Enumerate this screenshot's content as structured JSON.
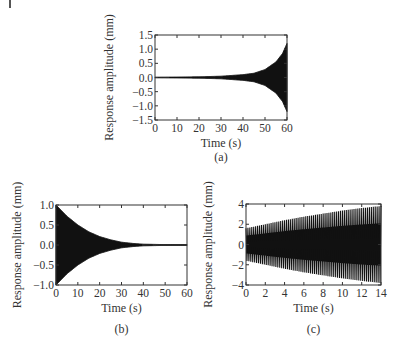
{
  "chart_data": [
    {
      "panel": "(a)",
      "type": "line",
      "title": "",
      "xlabel": "Time (s)",
      "ylabel": "Response amplitude (mm)",
      "xlim": [
        0,
        60
      ],
      "ylim": [
        -1.5,
        1.5
      ],
      "xticks": [
        0,
        10,
        20,
        30,
        40,
        50,
        60
      ],
      "yticks": [
        -1.5,
        -1.0,
        -0.5,
        0.0,
        0.5,
        1.0,
        1.5
      ],
      "ytick_labels": [
        "−1.5",
        "−1.0",
        "−0.5",
        "0.0",
        "0.5",
        "1.0",
        "1.5"
      ],
      "grid": false,
      "description": "Dense oscillation with exponentially growing envelope",
      "envelope": {
        "x": [
          0,
          10,
          20,
          30,
          40,
          45,
          50,
          55,
          58,
          60
        ],
        "upper": [
          0.01,
          0.015,
          0.025,
          0.045,
          0.1,
          0.15,
          0.28,
          0.55,
          0.85,
          1.2
        ],
        "lower": [
          -0.01,
          -0.015,
          -0.025,
          -0.045,
          -0.1,
          -0.15,
          -0.28,
          -0.55,
          -0.85,
          -1.2
        ]
      },
      "caption": "(a)"
    },
    {
      "panel": "(b)",
      "type": "line",
      "title": "",
      "xlabel": "Time (s)",
      "ylabel": "Response amplitude (mm)",
      "xlim": [
        0,
        60
      ],
      "ylim": [
        -1.0,
        1.0
      ],
      "xticks": [
        0,
        10,
        20,
        30,
        40,
        50,
        60
      ],
      "yticks": [
        -1.0,
        -0.5,
        0.0,
        0.5,
        1.0
      ],
      "ytick_labels": [
        "−1.0",
        "−0.5",
        "0.0",
        "0.5",
        "1.0"
      ],
      "grid": false,
      "description": "Dense oscillation with exponentially decaying envelope",
      "envelope": {
        "x": [
          0,
          5,
          10,
          15,
          20,
          25,
          30,
          35,
          40,
          50,
          60
        ],
        "upper": [
          1.0,
          0.72,
          0.5,
          0.33,
          0.21,
          0.13,
          0.07,
          0.04,
          0.02,
          0.01,
          0.01
        ],
        "lower": [
          -1.0,
          -0.72,
          -0.5,
          -0.33,
          -0.21,
          -0.13,
          -0.07,
          -0.04,
          -0.02,
          -0.01,
          -0.01
        ]
      },
      "caption": "(b)"
    },
    {
      "panel": "(c)",
      "type": "line",
      "title": "",
      "xlabel": "Time (s)",
      "ylabel": "Response amplitude (mm)",
      "xlim": [
        0,
        14
      ],
      "ylim": [
        -4,
        4
      ],
      "xticks": [
        0,
        2,
        4,
        6,
        8,
        10,
        12,
        14
      ],
      "yticks": [
        -4,
        -2,
        0,
        2,
        4
      ],
      "ytick_labels": [
        "−4",
        "−2",
        "0",
        "2",
        "4"
      ],
      "grid": false,
      "description": "Oscillation with slowly growing envelope, visible vertical cycles",
      "envelope": {
        "x": [
          0,
          2,
          4,
          6,
          8,
          10,
          12,
          14
        ],
        "upper": [
          1.6,
          2.0,
          2.4,
          2.75,
          3.05,
          3.35,
          3.6,
          3.8
        ],
        "lower": [
          -1.6,
          -2.0,
          -2.4,
          -2.75,
          -3.05,
          -3.35,
          -3.6,
          -3.8
        ]
      },
      "cycles_visible": 70,
      "caption": "(c)"
    }
  ]
}
